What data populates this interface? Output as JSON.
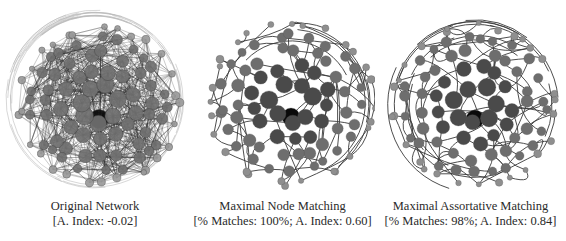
{
  "figure": {
    "panels": [
      {
        "id": "original",
        "title": "Original Network",
        "subtitle": "[A. Index: -0.02]",
        "metrics": {
          "assortativity_index": -0.02
        },
        "style": "dense",
        "center": [
          95,
          99
        ],
        "radius": 85,
        "caption_left": 0,
        "caption_width": 190,
        "panel_left": 0,
        "panel_width": 190
      },
      {
        "id": "node-matching",
        "title": "Maximal Node Matching",
        "subtitle": "[% Matches: 100%; A. Index: 0.60]",
        "metrics": {
          "percent_matches": "100%",
          "assortativity_index": 0.6
        },
        "style": "sparse",
        "center": [
          97,
          97
        ],
        "radius": 88,
        "caption_left": 0,
        "caption_width": 185,
        "panel_left": 190,
        "panel_width": 185
      },
      {
        "id": "assortative-matching",
        "title": "Maximal Assortative Matching",
        "subtitle": "[% Matches: 98%; A. Index: 0.84]",
        "metrics": {
          "percent_matches": "98%",
          "assortativity_index": 0.84
        },
        "style": "sparse-arcs",
        "center": [
          96,
          99
        ],
        "radius": 88,
        "caption_left": 0,
        "caption_width": 191,
        "panel_left": 375,
        "panel_width": 191
      }
    ],
    "colors": {
      "hub": "#0a0a0a",
      "dark": "#4a4a4a",
      "mid": "#6e6e6e",
      "light": "#8f8f8f",
      "edge_dense": "#2b2b2b",
      "edge_sparse": "#3a3a3a",
      "halo": "#b8b8b8"
    }
  }
}
